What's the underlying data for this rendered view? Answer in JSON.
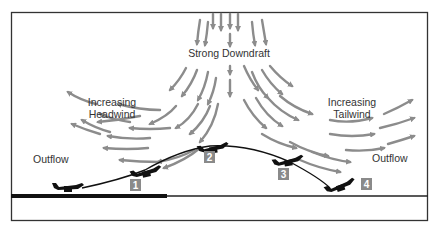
{
  "diagram": {
    "title_label": "Strong Downdraft",
    "headwind_label_line1": "Increasing",
    "headwind_label_line2": "Headwind",
    "tailwind_label_line1": "Increasing",
    "tailwind_label_line2": "Tailwind",
    "outflow_left_label": "Outflow",
    "outflow_right_label": "Outflow",
    "positions": [
      "1",
      "2",
      "3",
      "4"
    ],
    "colors": {
      "arrow": "#8c8c8c",
      "frame": "#333333",
      "ground": "#111111",
      "badge_bg": "#8a8a8a",
      "badge_text": "#ffffff",
      "text": "#333333",
      "aircraft": "#111111"
    }
  }
}
